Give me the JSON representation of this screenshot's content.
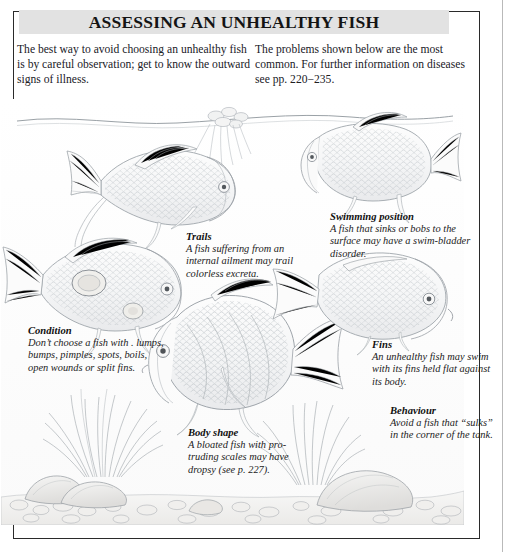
{
  "page": {
    "title": "ASSESSING AN UNHEALTHY FISH",
    "intro_left": "The best way to avoid choosing an unhealthy fish is by careful observation; get to know the outward signs of illness.",
    "intro_right": "The problems shown below are the most common. For further information on diseases see pp. 220−235."
  },
  "captions": {
    "trails": {
      "title": "Trails",
      "body": "A fish suffering from an internal ailment may trail colorless excreta."
    },
    "swimming_position": {
      "title": "Swimming position",
      "body": "A fish that sinks or bobs to the surface may have a swim-bladder disorder."
    },
    "condition": {
      "title": "Condition",
      "body": "Don’t choose a fish with . lumps, bumps, pimples, spots, boils, open wounds or split fins."
    },
    "fins": {
      "title": "Fins",
      "body": "An unhealthy fish may swim with its fins held flat against its body."
    },
    "body_shape": {
      "title": "Body shape",
      "body": "A bloated fish with pro-truding scales may have dropsy (see p. 227)."
    },
    "behaviour": {
      "title": "Behaviour",
      "body": "Avoid a fish that “sulks” in the corner of the tank."
    }
  },
  "illustration": {
    "alt": "Pencil line drawing of an aquarium cross-section showing six fish displaying signs of ill health, with gravel, rocks and plants",
    "elements": [
      "water-surface-line",
      "fish-with-trailing-excreta",
      "fish-surface-swimming",
      "fish-with-body-lesions",
      "fish-bloated-body",
      "fish-clamped-fins",
      "fish-sulking-in-corner",
      "aquarium-plant-left",
      "aquarium-plant-right",
      "floating-plant",
      "gravel-bed",
      "rocks"
    ]
  },
  "colors": {
    "title_band": "#e2e2e2",
    "frame_border": "#2a2a2a",
    "ink": "#1c1c1c",
    "line_art": "#9aa0a6",
    "page_background": "#ffffff"
  }
}
